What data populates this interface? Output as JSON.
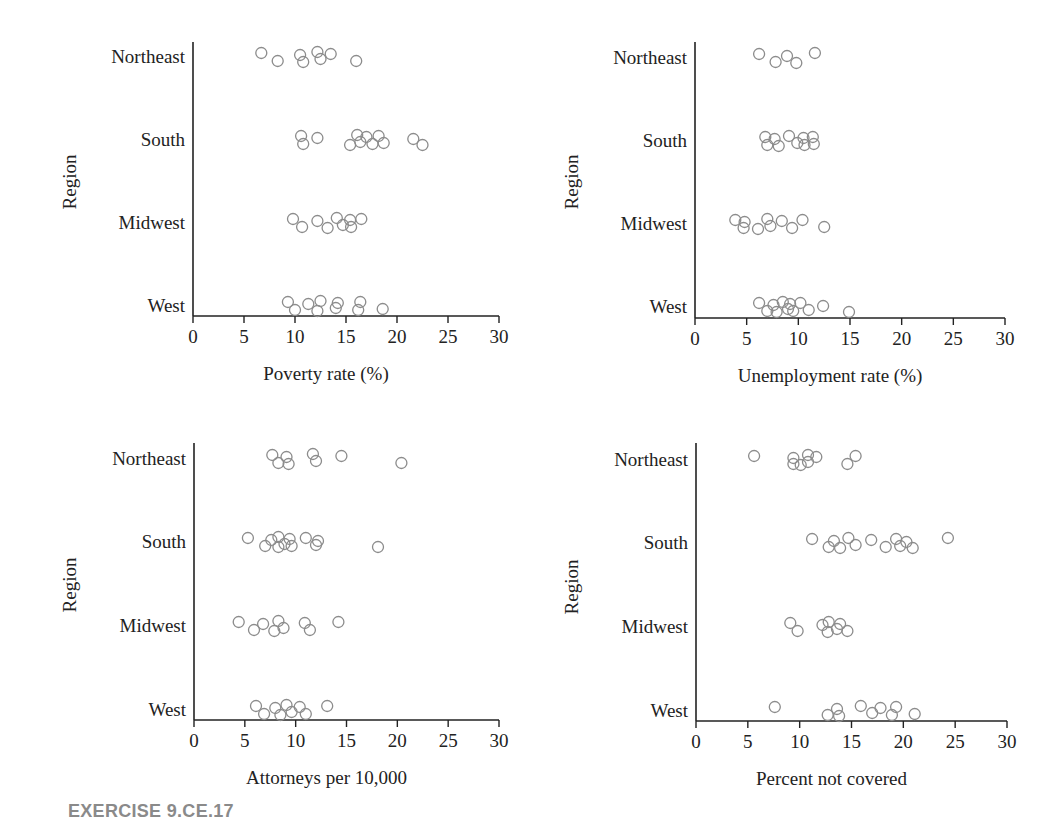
{
  "figure_label": "EXERCISE 9.CE.17",
  "chart_data": [
    {
      "type": "scatter",
      "title": "",
      "xlabel": "Poverty rate (%)",
      "ylabel": "Region",
      "xlim": [
        0,
        30
      ],
      "xticks": [
        0,
        5,
        10,
        15,
        20,
        25,
        30
      ],
      "categories": [
        "Northeast",
        "South",
        "Midwest",
        "West"
      ],
      "grid": false,
      "series": [
        {
          "name": "Northeast",
          "values": [
            6.7,
            8.3,
            10.5,
            10.8,
            12.2,
            12.5,
            13.5,
            16.0
          ]
        },
        {
          "name": "South",
          "values": [
            10.6,
            10.8,
            12.2,
            15.4,
            16.1,
            16.4,
            17.0,
            17.6,
            18.2,
            18.7,
            21.6,
            22.5
          ]
        },
        {
          "name": "Midwest",
          "values": [
            9.8,
            10.7,
            12.2,
            13.2,
            14.1,
            14.7,
            15.4,
            15.5,
            16.5
          ]
        },
        {
          "name": "West",
          "values": [
            9.3,
            10.0,
            11.3,
            12.2,
            12.5,
            14.0,
            14.2,
            16.2,
            16.4,
            18.6
          ]
        }
      ]
    },
    {
      "type": "scatter",
      "title": "",
      "xlabel": "Unemployment rate (%)",
      "ylabel": "Region",
      "xlim": [
        0,
        30
      ],
      "xticks": [
        0,
        5,
        10,
        15,
        20,
        25,
        30
      ],
      "categories": [
        "Northeast",
        "South",
        "Midwest",
        "West"
      ],
      "grid": false,
      "series": [
        {
          "name": "Northeast",
          "values": [
            6.2,
            7.8,
            8.9,
            9.8,
            11.6
          ]
        },
        {
          "name": "South",
          "values": [
            6.8,
            7.0,
            7.7,
            8.1,
            9.1,
            9.9,
            10.5,
            10.6,
            11.4,
            11.5
          ]
        },
        {
          "name": "Midwest",
          "values": [
            3.9,
            4.7,
            4.8,
            6.1,
            7.0,
            7.3,
            8.4,
            9.4,
            10.4,
            12.5
          ]
        },
        {
          "name": "West",
          "values": [
            6.2,
            7.0,
            7.6,
            7.9,
            8.5,
            9.0,
            9.2,
            9.5,
            10.2,
            11.0,
            12.4,
            14.9
          ]
        }
      ]
    },
    {
      "type": "scatter",
      "title": "",
      "xlabel": "Attorneys per 10,000",
      "ylabel": "Region",
      "xlim": [
        0,
        30
      ],
      "xticks": [
        0,
        5,
        10,
        15,
        20,
        25,
        30
      ],
      "categories": [
        "Northeast",
        "South",
        "Midwest",
        "West"
      ],
      "grid": false,
      "series": [
        {
          "name": "Northeast",
          "values": [
            7.7,
            8.3,
            9.1,
            9.3,
            11.7,
            12.0,
            14.5,
            20.4
          ]
        },
        {
          "name": "South",
          "values": [
            5.3,
            7.0,
            7.6,
            8.3,
            8.3,
            8.9,
            9.4,
            9.6,
            11.0,
            12.0,
            12.2,
            18.1
          ]
        },
        {
          "name": "Midwest",
          "values": [
            4.4,
            5.9,
            6.8,
            7.9,
            8.3,
            8.8,
            10.9,
            11.4,
            14.2
          ]
        },
        {
          "name": "West",
          "values": [
            6.1,
            6.9,
            8.0,
            8.5,
            9.1,
            9.6,
            10.4,
            11.0,
            13.1
          ]
        }
      ]
    },
    {
      "type": "scatter",
      "title": "",
      "xlabel": "Percent not covered",
      "ylabel": "Region",
      "xlim": [
        0,
        30
      ],
      "xticks": [
        0,
        5,
        10,
        15,
        20,
        25,
        30
      ],
      "categories": [
        "Northeast",
        "South",
        "Midwest",
        "West"
      ],
      "grid": false,
      "series": [
        {
          "name": "Northeast",
          "values": [
            5.6,
            9.4,
            9.4,
            10.1,
            10.8,
            10.8,
            11.6,
            14.6,
            15.4
          ]
        },
        {
          "name": "South",
          "values": [
            11.2,
            12.8,
            13.3,
            13.9,
            14.7,
            15.4,
            16.9,
            18.3,
            19.3,
            19.7,
            20.3,
            20.9,
            24.3
          ]
        },
        {
          "name": "Midwest",
          "values": [
            9.1,
            9.8,
            12.2,
            12.7,
            12.8,
            13.6,
            13.9,
            14.6
          ]
        },
        {
          "name": "West",
          "values": [
            7.6,
            12.7,
            13.6,
            13.8,
            15.9,
            17.0,
            17.8,
            18.9,
            19.3,
            21.1
          ]
        }
      ]
    }
  ]
}
